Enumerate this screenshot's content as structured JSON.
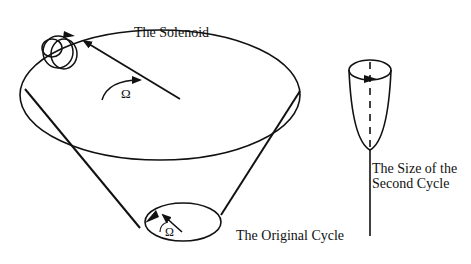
{
  "diagram": {
    "labels": {
      "solenoid": "The Solenoid",
      "omega_large": "Ω",
      "omega_small": "Ω",
      "original_cycle": "The Original Cycle",
      "second_cycle_line1": "The Size of the",
      "second_cycle_line2": "Second Cycle"
    },
    "elements": [
      "large-ellipse (cone top)",
      "cone-lines converging to original cycle",
      "solenoid coil at top-left of large ellipse",
      "radial arrow toward solenoid",
      "rotation arrow with Omega",
      "small ellipse (original cycle) with arrows and Omega",
      "cup shape (second cycle) with dashed axis and vertical stem"
    ],
    "colors": {
      "stroke": "#111111",
      "background": "#ffffff"
    }
  }
}
